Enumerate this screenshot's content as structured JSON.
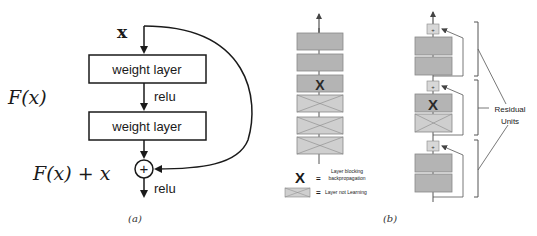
{
  "panel_a": {
    "caption": "(a)",
    "input_label": "x",
    "layer1_label": "weight layer",
    "activation1_label": "relu",
    "layer2_label": "weight layer",
    "residual_label": "F(x)",
    "sum_label": "F(x) + x",
    "add_symbol": "+",
    "activation2_label": "relu"
  },
  "panel_b": {
    "caption": "(b)",
    "plain_net": {
      "layers": [
        {
          "state": "learning"
        },
        {
          "state": "learning"
        },
        {
          "state": "blocking",
          "mark": "X"
        },
        {
          "state": "not-learning"
        },
        {
          "state": "not-learning"
        },
        {
          "state": "not-learning"
        }
      ]
    },
    "legend": {
      "blocking_symbol": "X",
      "equals": "=",
      "blocking_line1": "Layer blocking",
      "blocking_line2": "backpropagation",
      "not_learning_label": "Layer not Learning"
    },
    "residual_net": {
      "add_symbol": "+",
      "units": [
        {
          "layers": [
            {
              "state": "learning"
            },
            {
              "state": "learning"
            }
          ]
        },
        {
          "layers": [
            {
              "state": "blocking",
              "mark": "X"
            },
            {
              "state": "not-learning"
            }
          ]
        },
        {
          "layers": [
            {
              "state": "learning"
            },
            {
              "state": "learning"
            }
          ]
        }
      ],
      "brace_label_line1": "Residual",
      "brace_label_line2": "Units"
    }
  },
  "colors": {
    "stroke": "#1a1a1a",
    "layer_fill": "#b4b4b4",
    "layer_light_fill": "#cfcfcf",
    "line_gray": "#555555"
  }
}
